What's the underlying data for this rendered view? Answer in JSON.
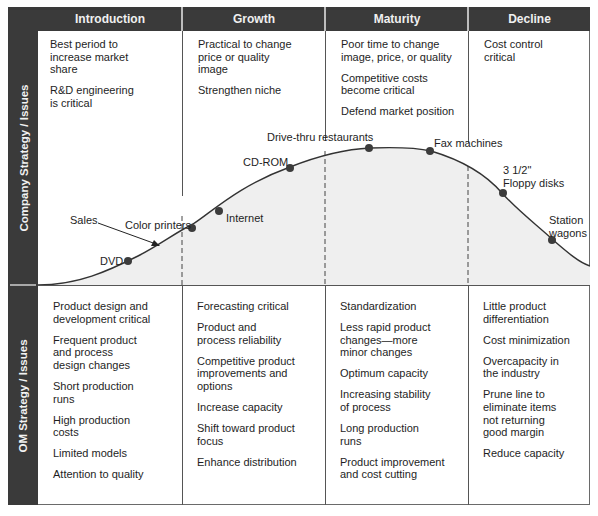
{
  "stages": [
    {
      "name": "Introduction"
    },
    {
      "name": "Growth"
    },
    {
      "name": "Maturity"
    },
    {
      "name": "Decline"
    }
  ],
  "row_labels": {
    "company": "Company Strategy / Issues",
    "om": "OM Strategy / Issues"
  },
  "company_strategy": {
    "introduction": [
      "Best period to\nincrease market\nshare",
      "R&D engineering\nis critical"
    ],
    "growth": [
      "Practical to change\nprice or quality\nimage",
      "Strengthen niche"
    ],
    "maturity": [
      "Poor time to change\nimage, price, or quality",
      "Competitive costs\nbecome critical",
      "Defend market position"
    ],
    "decline": [
      "Cost control\ncritical"
    ]
  },
  "om_strategy": {
    "introduction": [
      "Product design and\ndevelopment critical",
      "Frequent product\nand process\ndesign changes",
      "Short production\nruns",
      "High production\ncosts",
      "Limited models",
      "Attention to quality"
    ],
    "growth": [
      "Forecasting critical",
      "Product and\nprocess reliability",
      "Competitive product\nimprovements and\noptions",
      "Increase capacity",
      "Shift toward product\nfocus",
      "Enhance distribution"
    ],
    "maturity": [
      "Standardization",
      "Less rapid product\nchanges—more\nminor changes",
      "Optimum capacity",
      "Increasing stability\nof process",
      "Long production\nruns",
      "Product improvement\nand cost cutting"
    ],
    "decline": [
      "Little product\ndifferentiation",
      "Cost minimization",
      "Overcapacity in\nthe industry",
      "Prune line to\neliminate items\nnot returning\ngood margin",
      "Reduce capacity"
    ]
  },
  "curve": {
    "sales_label": "Sales",
    "products": [
      {
        "label": "DVD",
        "stage": "Introduction"
      },
      {
        "label": "Color printers",
        "stage": "Introduction/Growth boundary"
      },
      {
        "label": "Internet",
        "stage": "Growth"
      },
      {
        "label": "CD-ROM",
        "stage": "Growth"
      },
      {
        "label": "Drive-thru restaurants",
        "stage": "Maturity"
      },
      {
        "label": "Fax machines",
        "stage": "Maturity"
      },
      {
        "label": "3 1/2\"\nFloppy disks",
        "stage": "Decline"
      },
      {
        "label": "Station\nwagons",
        "stage": "Decline"
      }
    ]
  },
  "colors": {
    "header_bg": "#3a3a3a",
    "header_text": "#f0f0f0",
    "curve_fill": "#efefef",
    "curve_line": "#333333",
    "dot": "#3c3c3c"
  }
}
